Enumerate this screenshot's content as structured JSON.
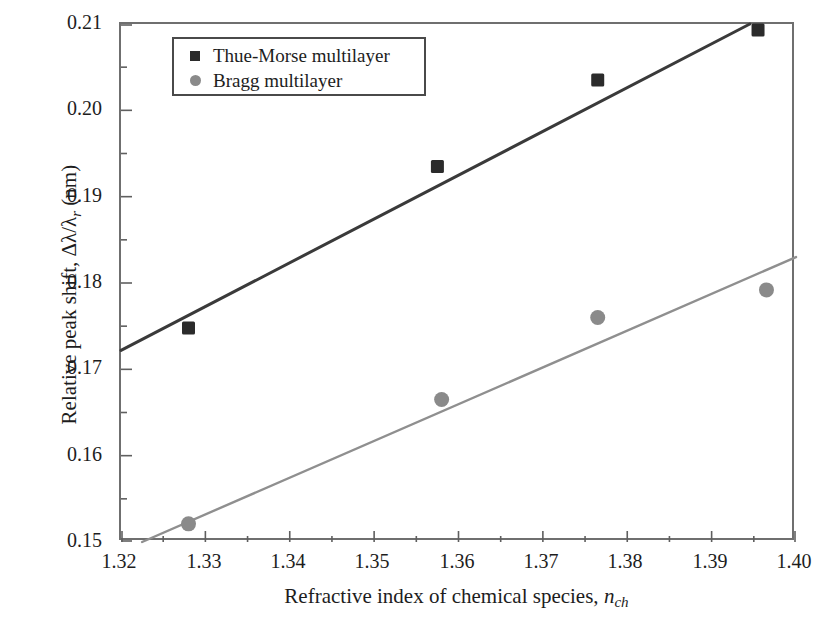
{
  "chart_data": {
    "type": "scatter",
    "title": "",
    "xlabel": "Refractive index of chemical species, n_ch",
    "ylabel": "Relative peak shift, Δλ/λ_r (nm)",
    "xlim": [
      1.32,
      1.4
    ],
    "ylim": [
      0.15,
      0.21
    ],
    "grid": false,
    "legend_position": "top-left-inside",
    "xticks": [
      "1.32",
      "1.33",
      "1.34",
      "1.35",
      "1.36",
      "1.37",
      "1.38",
      "1.39",
      "1.40"
    ],
    "xtick_values": [
      1.32,
      1.33,
      1.34,
      1.35,
      1.36,
      1.37,
      1.38,
      1.39,
      1.4
    ],
    "yticks": [
      "0.15",
      "0.16",
      "0.17",
      "0.18",
      "0.19",
      "0.20",
      "0.21"
    ],
    "ytick_values": [
      0.15,
      0.16,
      0.17,
      0.18,
      0.19,
      0.2,
      0.21
    ],
    "minor_ticks": true,
    "series": [
      {
        "name": "Thue-Morse multilayer",
        "marker": "square",
        "color": "#2b2b2b",
        "x": [
          1.328,
          1.3575,
          1.3765,
          1.3955
        ],
        "y": [
          0.1748,
          0.1935,
          0.2035,
          0.2093
        ],
        "fit_line": {
          "x": [
            1.32,
            1.3965
          ],
          "y": [
            0.1722,
            0.211
          ],
          "color": "#3a3a3a"
        }
      },
      {
        "name": "Bragg multilayer",
        "marker": "circle",
        "color": "#8a8a8a",
        "x": [
          1.328,
          1.358,
          1.3765,
          1.3965
        ],
        "y": [
          0.1521,
          0.1665,
          0.176,
          0.1792
        ],
        "fit_line": {
          "x": [
            1.3225,
            1.4
          ],
          "y": [
            0.15,
            0.183
          ],
          "color": "#8f8f8f"
        }
      }
    ]
  },
  "axes": {
    "x_title_prefix": "Refractive index of chemical species, ",
    "x_title_symbol": "n",
    "x_title_subscript": "ch",
    "y_title_prefix": "Relative peak shift, ",
    "y_title_delta": "Δλ/λ",
    "y_title_subscript": "r",
    "y_title_units": " (nm)"
  },
  "legend": {
    "entries": [
      {
        "label": "Thue-Morse multilayer",
        "marker": "square-marker"
      },
      {
        "label": "Bragg multilayer",
        "marker": "circle-marker"
      }
    ]
  }
}
